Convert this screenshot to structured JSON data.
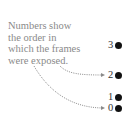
{
  "caption": {
    "lines": [
      "Numbers show",
      "the order in",
      "which the frames",
      "were exposed."
    ]
  },
  "frames": [
    {
      "label": "3",
      "top": 40,
      "left": 108
    },
    {
      "label": "2",
      "top": 70,
      "left": 108
    },
    {
      "label": "1",
      "top": 92,
      "left": 108
    },
    {
      "label": "0",
      "top": 103,
      "left": 108
    }
  ],
  "colors": {
    "caption_text": "#8a8a8a",
    "dot": "#111111",
    "arrow": "#8a8a8a"
  }
}
